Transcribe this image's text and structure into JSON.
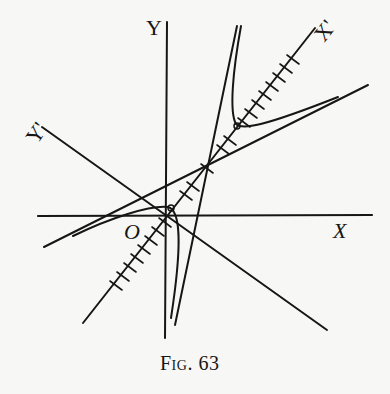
{
  "figure": {
    "caption": "Fig. 63",
    "labels": {
      "y_axis": "Y",
      "x_axis": "X",
      "origin": "O",
      "x_prime": "X'",
      "y_prime": "Y'"
    },
    "colors": {
      "ink": "#161616",
      "paper": "#f7f7f5"
    },
    "elements": {
      "original_axes": [
        "X",
        "Y"
      ],
      "rotated_axes": [
        "X'",
        "Y'"
      ],
      "x_prime_tick_count_upper": 9,
      "x_prime_tick_count_lower": 8,
      "asymptote_count": 2,
      "curve": "hyperbola (two branches)"
    }
  }
}
